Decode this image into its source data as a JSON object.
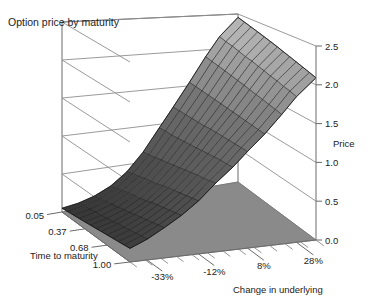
{
  "title": "Option price by maturity",
  "chart_data": {
    "type": "surface",
    "title": "Option price by maturity",
    "xlabel": "Change in underlying",
    "ylabel": "Time to maturity",
    "zlabel": "Price",
    "x_tick_labels": [
      "-33%",
      "-12%",
      "8%",
      "28%"
    ],
    "x_tick_values": [
      -33,
      -12,
      8,
      28
    ],
    "y_tick_labels": [
      "0.05",
      "0.37",
      "0.68",
      "1.00"
    ],
    "y_tick_values": [
      0.05,
      0.37,
      0.68,
      1.0
    ],
    "z_tick_labels": [
      "0.0",
      "0.5",
      "1.0",
      "1.5",
      "2.0",
      "2.5"
    ],
    "z_tick_values": [
      0.0,
      0.5,
      1.0,
      1.5,
      2.0,
      2.5
    ],
    "zlim": [
      0.0,
      2.5
    ],
    "xlim": [
      -40,
      36
    ],
    "ylim": [
      0.05,
      1.0
    ],
    "grid": true,
    "legend": "none",
    "x_axis_name": "Change in underlying",
    "y_axis_name": "Time to maturity",
    "z_axis_name": "Price",
    "surface_style": "wireframe-shaded",
    "shading": "grayscale-gradient-dark-low-light-high",
    "colors": {
      "floor": "#8a8a8a",
      "mesh_line": "#202020",
      "surface_light": "#c2c2c2",
      "surface_mid": "#6d6d6d",
      "surface_dark": "#343434",
      "axis": "#6b6b6b",
      "grid": "#8e8e8e",
      "text": "#222222",
      "background": "#ffffff"
    },
    "x_grid": [
      -40,
      -33,
      -26,
      -19,
      -12,
      -5,
      2,
      8,
      15,
      22,
      28,
      36
    ],
    "y_grid": [
      0.05,
      0.13,
      0.21,
      0.29,
      0.37,
      0.45,
      0.53,
      0.6,
      0.68,
      0.76,
      0.84,
      0.92,
      1.0
    ],
    "z_values": [
      [
        0.05,
        0.08,
        0.14,
        0.24,
        0.4,
        0.64,
        0.95,
        1.22,
        1.55,
        1.9,
        2.18,
        2.45
      ],
      [
        0.06,
        0.1,
        0.16,
        0.27,
        0.43,
        0.66,
        0.96,
        1.22,
        1.54,
        1.88,
        2.15,
        2.42
      ],
      [
        0.07,
        0.11,
        0.18,
        0.29,
        0.45,
        0.68,
        0.96,
        1.22,
        1.53,
        1.86,
        2.13,
        2.39
      ],
      [
        0.08,
        0.13,
        0.2,
        0.32,
        0.48,
        0.7,
        0.97,
        1.22,
        1.52,
        1.84,
        2.1,
        2.36
      ],
      [
        0.09,
        0.14,
        0.22,
        0.34,
        0.5,
        0.72,
        0.98,
        1.22,
        1.51,
        1.82,
        2.07,
        2.33
      ],
      [
        0.1,
        0.16,
        0.24,
        0.36,
        0.52,
        0.74,
        0.99,
        1.22,
        1.5,
        1.8,
        2.05,
        2.3
      ],
      [
        0.11,
        0.17,
        0.26,
        0.38,
        0.55,
        0.76,
        1.0,
        1.23,
        1.49,
        1.78,
        2.02,
        2.27
      ],
      [
        0.12,
        0.19,
        0.28,
        0.41,
        0.57,
        0.78,
        1.01,
        1.23,
        1.48,
        1.76,
        2.0,
        2.24
      ],
      [
        0.13,
        0.2,
        0.3,
        0.43,
        0.59,
        0.8,
        1.02,
        1.23,
        1.47,
        1.74,
        1.97,
        2.21
      ],
      [
        0.14,
        0.22,
        0.32,
        0.45,
        0.61,
        0.82,
        1.03,
        1.23,
        1.46,
        1.72,
        1.95,
        2.18
      ],
      [
        0.15,
        0.23,
        0.34,
        0.47,
        0.63,
        0.83,
        1.04,
        1.23,
        1.45,
        1.7,
        1.92,
        2.15
      ],
      [
        0.16,
        0.25,
        0.36,
        0.49,
        0.65,
        0.85,
        1.04,
        1.23,
        1.44,
        1.68,
        1.9,
        2.12
      ],
      [
        0.17,
        0.26,
        0.38,
        0.51,
        0.67,
        0.87,
        1.05,
        1.23,
        1.43,
        1.66,
        1.87,
        2.09
      ]
    ]
  },
  "axis_labels": {
    "x": "Change in underlying",
    "y": "Time to maturity",
    "z": "Price"
  }
}
